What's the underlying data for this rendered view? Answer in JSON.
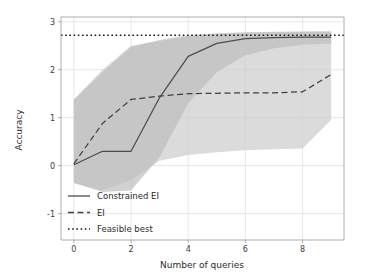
{
  "chart_data": {
    "type": "line",
    "title": "",
    "xlabel": "Number of queries",
    "ylabel": "Accuracy",
    "xlim": [
      -0.45,
      9.45
    ],
    "ylim": [
      -1.55,
      3.1
    ],
    "xticks": [
      0,
      2,
      4,
      6,
      8
    ],
    "xtick_labels": [
      "0",
      "2",
      "4",
      "6",
      "8"
    ],
    "yticks": [
      -1,
      0,
      1,
      2,
      3
    ],
    "ytick_labels": [
      "-1",
      "0",
      "1",
      "2",
      "3"
    ],
    "grid": true,
    "legend_position": "lower left",
    "x": [
      0,
      1,
      2,
      3,
      4,
      5,
      6,
      7,
      8,
      9
    ],
    "series": [
      {
        "name": "Constrained EI",
        "style": "solid",
        "color": "#4d4d4d",
        "values": [
          0.02,
          0.3,
          0.3,
          1.42,
          2.28,
          2.55,
          2.65,
          2.67,
          2.68,
          2.68
        ],
        "band_upper": [
          1.38,
          1.95,
          2.48,
          2.62,
          2.72,
          2.76,
          2.78,
          2.79,
          2.8,
          2.8
        ],
        "band_lower": [
          -0.36,
          -0.55,
          -0.52,
          0.18,
          1.3,
          1.95,
          2.3,
          2.45,
          2.52,
          2.55
        ]
      },
      {
        "name": "EI",
        "style": "dashed",
        "color": "#3f3f3f",
        "values": [
          0.04,
          0.88,
          1.38,
          1.45,
          1.5,
          1.51,
          1.52,
          1.52,
          1.54,
          1.9
        ],
        "band_upper": [
          1.38,
          2.0,
          2.5,
          2.6,
          2.7,
          2.74,
          2.77,
          2.78,
          2.79,
          2.8
        ],
        "band_lower": [
          -0.36,
          -0.52,
          -0.3,
          0.1,
          0.22,
          0.28,
          0.32,
          0.34,
          0.36,
          0.95
        ]
      },
      {
        "name": "Feasible best",
        "style": "dotted",
        "color": "#1a1a1a",
        "constant_value": 2.72
      }
    ],
    "band_colors": {
      "constrained_ei_band": "#bdbdbd",
      "ei_band": "#cfcfcf"
    }
  },
  "legend": {
    "items": [
      {
        "label": "Constrained EI",
        "style": "solid"
      },
      {
        "label": "EI",
        "style": "dashed"
      },
      {
        "label": "Feasible best",
        "style": "dotted"
      }
    ]
  },
  "axes": {
    "x_title": "Number of queries",
    "y_title": "Accuracy"
  }
}
